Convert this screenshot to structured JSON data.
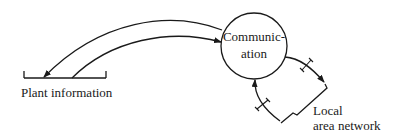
{
  "diagram": {
    "nodes": {
      "communication": {
        "line1": "Communic-",
        "line2": "ation",
        "shape": "circle"
      },
      "plant_information": {
        "label": "Plant information",
        "shape": "data-store-bracket"
      },
      "local_area_network": {
        "line1": "Local",
        "line2": "area network",
        "shape": "zigzag-link"
      }
    },
    "edges": [
      {
        "from": "communication",
        "to": "plant_information",
        "style": "curved-arrow"
      },
      {
        "from": "plant_information",
        "to": "communication",
        "style": "curved-arrow"
      },
      {
        "from": "communication",
        "to": "local_area_network",
        "style": "arrow-with-break-marker"
      },
      {
        "from": "local_area_network",
        "to": "communication",
        "style": "arrow-with-break-marker"
      }
    ],
    "colors": {
      "stroke": "#1a1a1a",
      "background": "#ffffff"
    }
  }
}
